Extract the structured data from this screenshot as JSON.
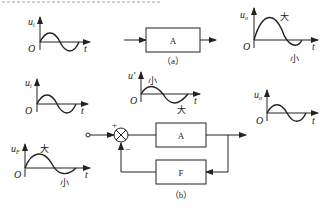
{
  "figure": {
    "part_a": {
      "caption": "（a）",
      "block_label": "A",
      "input_plot": {
        "y_label": "u",
        "y_sub": "i",
        "origin": "O",
        "x_label": "t"
      },
      "output_plot": {
        "y_label": "u",
        "y_sub": "o",
        "origin": "O",
        "x_label": "t",
        "peak_label": "大",
        "trough_label": "小"
      }
    },
    "part_b": {
      "caption": "（b）",
      "forward_block_label": "A",
      "feedback_block_label": "F",
      "sum_plus": "+",
      "sum_minus": "−",
      "input_plot": {
        "y_label": "u",
        "y_sub": "i",
        "origin": "O",
        "x_label": "t"
      },
      "net_plot": {
        "y_label": "u′",
        "origin": "O",
        "x_label": "t",
        "peak_label": "小",
        "trough_label": "大"
      },
      "output_plot": {
        "y_label": "u",
        "y_sub": "o",
        "origin": "O",
        "x_label": "t"
      },
      "feedback_plot": {
        "y_label": "u",
        "y_sub": "F",
        "origin": "O",
        "x_label": "t",
        "peak_label": "大",
        "trough_label": "小"
      }
    }
  }
}
